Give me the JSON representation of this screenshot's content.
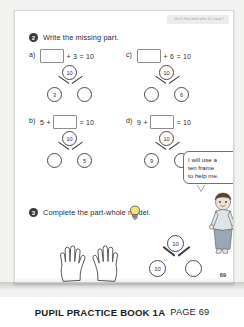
{
  "page": {
    "unit_header": "Unit 3: Parts whole within 10, Lesson 7",
    "page_number": "69"
  },
  "question2": {
    "number": "2",
    "prompt": "Write the missing part.",
    "parts": [
      {
        "label": "a)",
        "equation": {
          "first": "",
          "op1": "+",
          "second": "3",
          "op2": "=",
          "result": "10",
          "blank_position": "first"
        },
        "part_whole": {
          "whole": "10",
          "left": "3",
          "right": ""
        }
      },
      {
        "label": "c)",
        "equation": {
          "first": "",
          "op1": "+",
          "second": "6",
          "op2": "=",
          "result": "10",
          "blank_position": "first"
        },
        "part_whole": {
          "whole": "10",
          "left": "",
          "right": "6"
        }
      },
      {
        "label": "b)",
        "equation": {
          "first": "5",
          "op1": "+",
          "second": "",
          "op2": "=",
          "result": "10",
          "blank_position": "second"
        },
        "part_whole": {
          "whole": "10",
          "left": "",
          "right": "5"
        }
      },
      {
        "label": "d)",
        "equation": {
          "first": "9",
          "op1": "+",
          "second": "",
          "op2": "=",
          "result": "10",
          "blank_position": "second"
        },
        "part_whole": {
          "whole": "10",
          "left": "9",
          "right": ""
        }
      }
    ]
  },
  "speech_bubble": {
    "lines": [
      "I will use a",
      "ten frame",
      "to help me."
    ]
  },
  "question3": {
    "number": "3",
    "prompt": "Complete the part-whole model.",
    "hint_icon": "lightbulb-icon",
    "illustration": "two-open-hands",
    "part_whole": {
      "whole": "10",
      "left": "10",
      "right": ""
    }
  },
  "footer": {
    "title": "PUPIL PRACTICE BOOK 1A",
    "page_label": "PAGE 69"
  },
  "colors": {
    "ink": "#2b2b2b",
    "node_stroke": "#4a4a4a",
    "qnum_bg": "#3a3a3a",
    "page_bg": "#f2f2f0"
  }
}
